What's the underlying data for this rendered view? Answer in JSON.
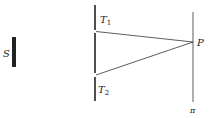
{
  "diagram": {
    "type": "double-slit",
    "source": {
      "label": "S"
    },
    "slits": [
      {
        "label": "T",
        "sub": "1"
      },
      {
        "label": "T",
        "sub": "2"
      }
    ],
    "point": {
      "label": "P"
    },
    "screen": {
      "label": "π"
    },
    "colors": {
      "ink": "#222222",
      "background": "#ffffff"
    }
  }
}
